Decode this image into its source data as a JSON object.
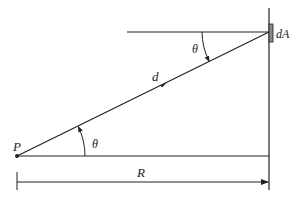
{
  "diagram": {
    "title": "",
    "labels": {
      "point": "P",
      "area_element": "dA",
      "distance": "d",
      "angle_bottom": "θ",
      "angle_top": "θ",
      "radius": "R"
    },
    "colors": {
      "line": "#222222",
      "background": "#ffffff",
      "area_fill": "#888888"
    }
  }
}
